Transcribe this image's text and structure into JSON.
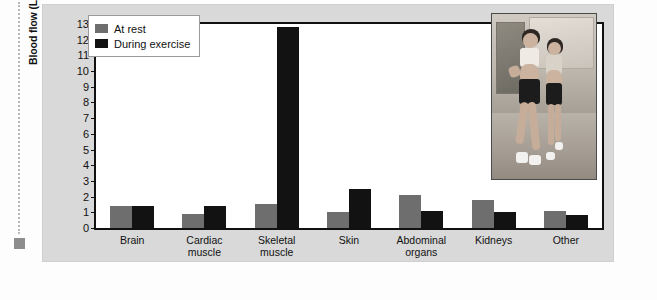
{
  "figure": {
    "background_color": "#d9d9d9",
    "plot_background_color": "#ffffff"
  },
  "legend": {
    "position": "top-left-inside",
    "entries": [
      {
        "label": "At rest",
        "color": "#6e6e6e",
        "swatch_name": "legend-swatch-at-rest"
      },
      {
        "label": "During exercise",
        "color": "#121212",
        "swatch_name": "legend-swatch-during-exercise"
      }
    ]
  },
  "inset": {
    "name": "step-aerobics-photo",
    "description": "Two women performing step aerobics exercise in a gym"
  },
  "chart_data": {
    "type": "bar",
    "title": "",
    "xlabel": "",
    "ylabel": "Blood flow (L/min)",
    "ylim": [
      0,
      13
    ],
    "ytick_labels": [
      "0",
      "1",
      "2",
      "3",
      "4",
      "5",
      "6",
      "7",
      "8",
      "9",
      "10",
      "11",
      "12",
      "13"
    ],
    "ytick_values": [
      0,
      1,
      2,
      3,
      4,
      5,
      6,
      7,
      8,
      9,
      10,
      11,
      12,
      13
    ],
    "grid": false,
    "legend_position": "upper left",
    "categories": [
      "Brain",
      "Cardiac muscle",
      "Skeletal muscle",
      "Skin",
      "Abdominal organs",
      "Kidneys",
      "Other"
    ],
    "category_lines": [
      [
        "Brain"
      ],
      [
        "Cardiac",
        "muscle"
      ],
      [
        "Skeletal",
        "muscle"
      ],
      [
        "Skin"
      ],
      [
        "Abdominal",
        "organs"
      ],
      [
        "Kidneys"
      ],
      [
        "Other"
      ]
    ],
    "series": [
      {
        "name": "At rest",
        "color": "#6e6e6e",
        "values": [
          1.4,
          0.9,
          1.5,
          1.0,
          2.1,
          1.8,
          1.1
        ]
      },
      {
        "name": "During exercise",
        "color": "#121212",
        "values": [
          1.4,
          1.4,
          12.8,
          2.5,
          1.1,
          1.0,
          0.8
        ]
      }
    ]
  }
}
